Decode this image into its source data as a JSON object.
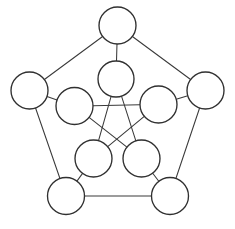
{
  "diagram": {
    "type": "graph-diagram",
    "canvas": {
      "width": 235,
      "height": 229
    },
    "style": {
      "background_color": "#ffffff",
      "node_fill": "#ffffff",
      "node_stroke": "#303030",
      "node_stroke_width": 1.35,
      "edge_stroke": "#3a3a3a",
      "edge_stroke_width": 1.05
    },
    "node_count": 10,
    "edge_count": 15,
    "nodes": [
      {
        "id": "outer-top",
        "label": "",
        "cx": 117.5,
        "cy": 25.5,
        "r": 18.5,
        "ring": "outer"
      },
      {
        "id": "outer-left",
        "label": "",
        "cx": 29.5,
        "cy": 90.5,
        "r": 18.5,
        "ring": "outer"
      },
      {
        "id": "outer-right",
        "label": "",
        "cx": 205.5,
        "cy": 90.5,
        "r": 18.5,
        "ring": "outer"
      },
      {
        "id": "outer-bottom-left",
        "label": "",
        "cx": 66.0,
        "cy": 196.0,
        "r": 18.5,
        "ring": "outer"
      },
      {
        "id": "outer-bottom-right",
        "label": "",
        "cx": 170.0,
        "cy": 196.0,
        "r": 18.5,
        "ring": "outer"
      },
      {
        "id": "inner-top",
        "label": "",
        "cx": 116.0,
        "cy": 79.0,
        "r": 18.0,
        "ring": "inner"
      },
      {
        "id": "inner-left",
        "label": "",
        "cx": 74.5,
        "cy": 106.0,
        "r": 18.5,
        "ring": "inner"
      },
      {
        "id": "inner-right",
        "label": "",
        "cx": 158.5,
        "cy": 104.5,
        "r": 18.5,
        "ring": "inner"
      },
      {
        "id": "inner-bottom-left",
        "label": "",
        "cx": 93.5,
        "cy": 158.5,
        "r": 18.5,
        "ring": "inner"
      },
      {
        "id": "inner-bottom-right",
        "label": "",
        "cx": 141.5,
        "cy": 158.5,
        "r": 18.5,
        "ring": "inner"
      }
    ],
    "edges": [
      {
        "from": "outer-top",
        "to": "outer-left",
        "kind": "pentagon"
      },
      {
        "from": "outer-top",
        "to": "outer-right",
        "kind": "pentagon"
      },
      {
        "from": "outer-left",
        "to": "outer-bottom-left",
        "kind": "pentagon"
      },
      {
        "from": "outer-right",
        "to": "outer-bottom-right",
        "kind": "pentagon"
      },
      {
        "from": "outer-bottom-left",
        "to": "outer-bottom-right",
        "kind": "pentagon"
      },
      {
        "from": "outer-top",
        "to": "inner-top",
        "kind": "spoke"
      },
      {
        "from": "outer-left",
        "to": "inner-left",
        "kind": "spoke"
      },
      {
        "from": "outer-right",
        "to": "inner-right",
        "kind": "spoke"
      },
      {
        "from": "outer-bottom-left",
        "to": "inner-bottom-left",
        "kind": "spoke"
      },
      {
        "from": "outer-bottom-right",
        "to": "inner-bottom-right",
        "kind": "spoke"
      },
      {
        "from": "inner-top",
        "to": "inner-bottom-left",
        "kind": "pentagram"
      },
      {
        "from": "inner-top",
        "to": "inner-bottom-right",
        "kind": "pentagram"
      },
      {
        "from": "inner-left",
        "to": "inner-right",
        "kind": "pentagram"
      },
      {
        "from": "inner-left",
        "to": "inner-bottom-right",
        "kind": "pentagram"
      },
      {
        "from": "inner-right",
        "to": "inner-bottom-left",
        "kind": "pentagram"
      }
    ]
  }
}
